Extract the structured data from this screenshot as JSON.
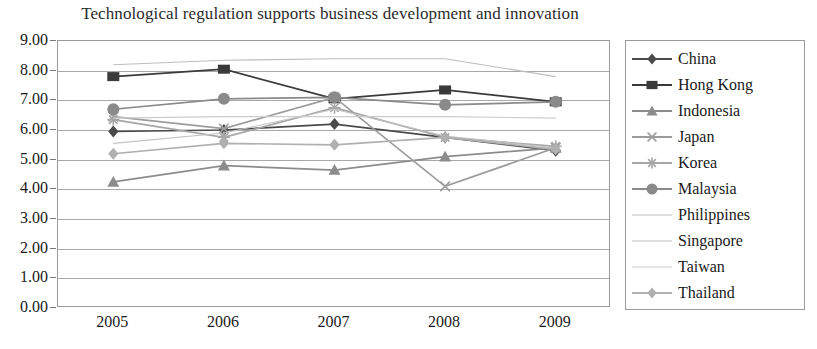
{
  "chart_data": {
    "type": "line",
    "title": "Technological regulation supports business development and innovation",
    "xlabel": "",
    "ylabel": "",
    "categories": [
      "2005",
      "2006",
      "2007",
      "2008",
      "2009"
    ],
    "x_tick_labels": [
      "2005",
      "2006",
      "2007",
      "2008",
      "2009"
    ],
    "y_tick_labels": [
      "9.00",
      "8.00",
      "7.00",
      "6.00",
      "5.00",
      "4.00",
      "3.00",
      "2.00",
      "1.00",
      "0.00"
    ],
    "ylim": [
      0,
      9
    ],
    "y_tick_step": 1,
    "grid": true,
    "legend_position": "right",
    "series": [
      {
        "name": "China",
        "marker": "diamond",
        "color": "#4a4a4a",
        "values": [
          5.95,
          6.0,
          6.2,
          5.75,
          5.3
        ]
      },
      {
        "name": "Hong Kong",
        "marker": "square",
        "color": "#3a3a3a",
        "values": [
          7.8,
          8.05,
          7.05,
          7.35,
          6.95
        ]
      },
      {
        "name": "Indonesia",
        "marker": "triangle",
        "color": "#8c8c8c",
        "values": [
          4.25,
          4.8,
          4.65,
          5.1,
          5.4
        ]
      },
      {
        "name": "Japan",
        "marker": "x",
        "color": "#9c9c9c",
        "values": [
          6.45,
          6.05,
          7.1,
          4.1,
          5.4
        ]
      },
      {
        "name": "Korea",
        "marker": "star",
        "color": "#a6a6a6",
        "values": [
          6.35,
          5.75,
          6.75,
          5.75,
          5.45
        ]
      },
      {
        "name": "Malaysia",
        "marker": "circle",
        "color": "#8a8a8a",
        "values": [
          6.7,
          7.05,
          7.1,
          6.85,
          6.95
        ]
      },
      {
        "name": "Philippines",
        "marker": "none",
        "color": "#c2c2c2",
        "values": [
          5.55,
          5.9,
          6.7,
          5.8,
          5.4
        ]
      },
      {
        "name": "Singapore",
        "marker": "none",
        "color": "#bdbdbd",
        "values": [
          8.2,
          8.35,
          8.4,
          8.4,
          7.8
        ]
      },
      {
        "name": "Taiwan",
        "marker": "none",
        "color": "#cccccc",
        "values": [
          6.4,
          6.45,
          6.45,
          6.45,
          6.4
        ]
      },
      {
        "name": "Thailand",
        "marker": "diamond",
        "color": "#b0b0b0",
        "values": [
          5.2,
          5.55,
          5.5,
          5.75,
          5.35
        ]
      }
    ]
  },
  "colors": {
    "axis": "#9a9a9a",
    "gridline": "#a8a8a8",
    "text": "#1a1a1a",
    "title": "#2b2b2b",
    "plot_background": "#ffffff"
  }
}
